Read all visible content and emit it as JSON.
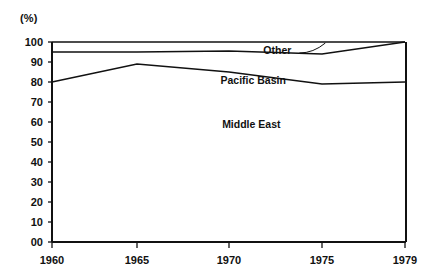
{
  "chart_data": {
    "type": "line",
    "title": "",
    "subtitle": "",
    "unit_label": "(%)",
    "xlabel": "",
    "ylabel": "",
    "x": [
      1960,
      1965,
      1970,
      1975,
      1979
    ],
    "xtick_labels": [
      "1960",
      "1965",
      "1970",
      "1975",
      "1979"
    ],
    "xlim": [
      1960,
      1979
    ],
    "ylim": [
      0,
      100
    ],
    "ytick_values": [
      100,
      90,
      80,
      70,
      60,
      50,
      40,
      30,
      20,
      10,
      0
    ],
    "ytick_labels": [
      "100",
      "90",
      "80",
      "70",
      "60",
      "50",
      "40",
      "30",
      "20",
      "10",
      "00"
    ],
    "grid": false,
    "legend_position": "inline-annotations",
    "series": [
      {
        "name": "Middle East",
        "label": "Middle East",
        "values": [
          80,
          89,
          85,
          79,
          80
        ],
        "label_x": 1971.2,
        "label_y": 57,
        "color": "#111111"
      },
      {
        "name": "Pacific Basin",
        "label": "Pacific Basin",
        "values": [
          95,
          95,
          95.5,
          94,
          100
        ],
        "label_x": 1971.3,
        "label_y": 79,
        "color": "#111111"
      },
      {
        "name": "Other",
        "label": "Other",
        "values": [
          100,
          100,
          100,
          100,
          100
        ],
        "label_x": 1972.6,
        "label_y": 94,
        "color": "#111111"
      }
    ],
    "annotations": [
      {
        "text": "Other",
        "target_series": "Other",
        "kind": "leader-line"
      }
    ],
    "axis_color": "#111111",
    "background_color": "#ffffff"
  }
}
